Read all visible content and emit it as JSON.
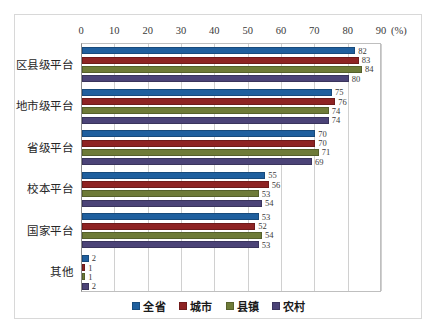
{
  "chart_data": {
    "type": "bar",
    "orientation": "horizontal",
    "title": "",
    "subtitle": "",
    "xlabel": "(%)",
    "ylabel": "",
    "xlim": [
      0,
      90
    ],
    "xticks": [
      0,
      10,
      20,
      30,
      40,
      50,
      60,
      70,
      80,
      90
    ],
    "grid": true,
    "legend_position": "bottom",
    "unit_label": "(%)",
    "categories": [
      "区县级平台",
      "地市级平台",
      "省级平台",
      "校本平台",
      "国家平台",
      "其他"
    ],
    "series": [
      {
        "name": "全省",
        "color": "#1F5F9E",
        "values": [
          82,
          75,
          70,
          55,
          53,
          2
        ]
      },
      {
        "name": "城市",
        "color": "#8E2323",
        "values": [
          83,
          76,
          70,
          56,
          52,
          1
        ]
      },
      {
        "name": "县镇",
        "color": "#6E7B38",
        "values": [
          84,
          74,
          71,
          53,
          54,
          1
        ]
      },
      {
        "name": "农村",
        "color": "#4B4377",
        "values": [
          80,
          74,
          69,
          54,
          53,
          2
        ]
      }
    ]
  },
  "axis": {
    "tick_labels": [
      "0",
      "10",
      "20",
      "30",
      "40",
      "50",
      "60",
      "70",
      "80",
      "90"
    ],
    "unit": "(%)"
  },
  "legend": {
    "items": [
      {
        "label": "全省"
      },
      {
        "label": "城市"
      },
      {
        "label": "县镇"
      },
      {
        "label": "农村"
      }
    ]
  }
}
